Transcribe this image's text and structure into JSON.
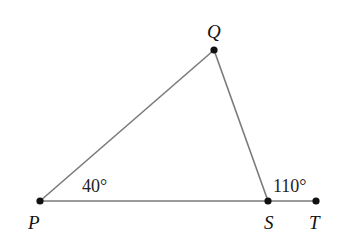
{
  "diagram": {
    "type": "triangle-exterior-angle",
    "points": {
      "P": {
        "label": "P",
        "x": 40,
        "y": 201
      },
      "Q": {
        "label": "Q",
        "x": 214,
        "y": 50
      },
      "S": {
        "label": "S",
        "x": 268,
        "y": 201
      },
      "T": {
        "label": "T",
        "x": 316,
        "y": 201
      }
    },
    "segments": [
      [
        "P",
        "Q"
      ],
      [
        "Q",
        "S"
      ],
      [
        "P",
        "S"
      ],
      [
        "S",
        "T"
      ]
    ],
    "angles": {
      "P": "40°",
      "exterior_S": "110°"
    },
    "colors": {
      "line": "#777777",
      "point": "#111111",
      "text": "#111111"
    }
  }
}
